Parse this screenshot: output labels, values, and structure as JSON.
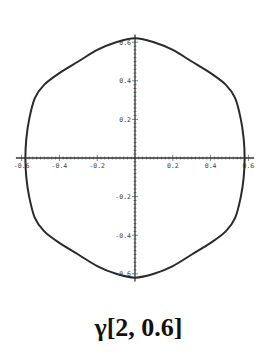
{
  "chart_data": {
    "type": "line",
    "title": "",
    "caption": "γ[2, 0.6]",
    "xlabel": "",
    "ylabel": "",
    "xlim": [
      -0.6,
      0.6
    ],
    "ylim": [
      -0.6,
      0.6
    ],
    "grid": false,
    "x_ticks": [
      -0.6,
      -0.4,
      -0.2,
      0.2,
      0.4,
      0.6
    ],
    "x_tick_labels": [
      "-0.6",
      "-0.4",
      "-0.2",
      "0.2",
      "0.4",
      "0.6"
    ],
    "y_ticks": [
      0.6,
      0.4,
      0.2,
      -0.2,
      -0.4,
      -0.6
    ],
    "y_tick_labels": [
      "0.6",
      "0.4",
      "0.2",
      "-0.2",
      "-0.4",
      "-0.6"
    ],
    "series": [
      {
        "name": "gamma[2, 0.6]",
        "description": "closed curve, rounded hexagon-like shape symmetric about both axes",
        "x": [
          0.0,
          0.1,
          0.2,
          0.3,
          0.4,
          0.48,
          0.53,
          0.56,
          0.575,
          0.58,
          0.575,
          0.56,
          0.53,
          0.48,
          0.4,
          0.3,
          0.2,
          0.1,
          0.0,
          -0.1,
          -0.2,
          -0.3,
          -0.4,
          -0.48,
          -0.53,
          -0.56,
          -0.575,
          -0.58,
          -0.575,
          -0.56,
          -0.53,
          -0.48,
          -0.4,
          -0.3,
          -0.2,
          -0.1,
          0.0
        ],
        "y": [
          0.62,
          0.6,
          0.56,
          0.5,
          0.44,
          0.38,
          0.31,
          0.2,
          0.1,
          0.0,
          -0.1,
          -0.2,
          -0.31,
          -0.38,
          -0.44,
          -0.5,
          -0.56,
          -0.6,
          -0.62,
          -0.6,
          -0.56,
          -0.5,
          -0.44,
          -0.38,
          -0.31,
          -0.2,
          -0.1,
          0.0,
          0.1,
          0.2,
          0.31,
          0.38,
          0.44,
          0.5,
          0.56,
          0.6,
          0.62
        ]
      }
    ]
  },
  "colors": {
    "curve": "#2a2a2a",
    "axes": "#333333",
    "labels": "#444444"
  }
}
